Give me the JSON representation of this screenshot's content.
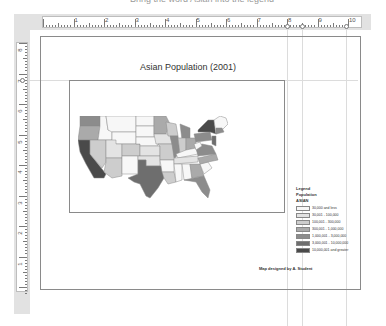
{
  "top_cropped_text": "Bring the word Asian into the legend",
  "ruler": {
    "horizontal_labels": [
      "1",
      "2",
      "3",
      "4",
      "5",
      "6",
      "7",
      "8",
      "9",
      "10"
    ],
    "vertical_labels": [
      "8",
      "7",
      "6",
      "5",
      "4",
      "3",
      "2",
      "1"
    ]
  },
  "map_layout": {
    "title": "Asian Population (2001)",
    "credit": "Map designed by A. Student",
    "legend": {
      "heading": "Legend",
      "layer": "Population",
      "field": "ASIAN",
      "classes": [
        {
          "label": "30,000 and less",
          "color": "#f7f7f7"
        },
        {
          "label": "30,001 - 100,000",
          "color": "#e3e3e3"
        },
        {
          "label": "100,001 - 300,000",
          "color": "#cdcdcd"
        },
        {
          "label": "300,001 - 1,000,000",
          "color": "#aaaaaa"
        },
        {
          "label": "1,000,001 - 3,000,000",
          "color": "#8c8c8c"
        },
        {
          "label": "3,000,001 - 10,000,000",
          "color": "#6e6e6e"
        },
        {
          "label": "10,000,001 and greater",
          "color": "#4a4a4a"
        }
      ]
    }
  }
}
